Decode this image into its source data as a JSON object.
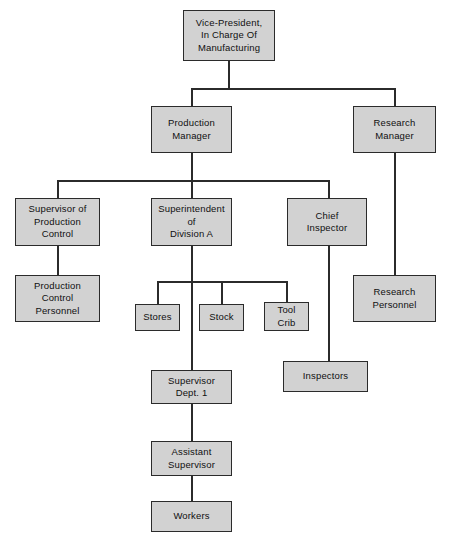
{
  "chart": {
    "type": "org-chart",
    "background_color": "#ffffff",
    "box_fill_color": "#d2d2d2",
    "box_border_color": "#2b2b2b",
    "connector_color": "#2b2b2b",
    "text_color": "#101010"
  },
  "nodes": {
    "vice_president": {
      "label": "Vice-President,\nIn Charge Of\nManufacturing",
      "level": 1
    },
    "production_manager": {
      "label": "Production\nManager",
      "level": 2
    },
    "research_manager": {
      "label": "Research\nManager",
      "level": 2
    },
    "supervisor_production_control": {
      "label": "Supervisor of\nProduction\nControl",
      "level": 3
    },
    "superintendent_division_a": {
      "label": "Superintendent\nof\nDivision A",
      "level": 3
    },
    "chief_inspector": {
      "label": "Chief\nInspector",
      "level": 3
    },
    "production_control_personnel": {
      "label": "Production\nControl\nPersonnel",
      "level": 4
    },
    "stores": {
      "label": "Stores",
      "level": 4
    },
    "stock": {
      "label": "Stock",
      "level": 4
    },
    "tool_crib": {
      "label": "Tool\nCrib",
      "level": 4
    },
    "research_personnel": {
      "label": "Research\nPersonnel",
      "level": 4
    },
    "inspectors": {
      "label": "Inspectors",
      "level": 4
    },
    "supervisor_dept_1": {
      "label": "Supervisor\nDept. 1",
      "level": 5
    },
    "assistant_supervisor": {
      "label": "Assistant\nSupervisor",
      "level": 6
    },
    "workers": {
      "label": "Workers",
      "level": 7
    }
  },
  "edges": [
    {
      "from": "vice_president",
      "to": "production_manager"
    },
    {
      "from": "vice_president",
      "to": "research_manager"
    },
    {
      "from": "production_manager",
      "to": "supervisor_production_control"
    },
    {
      "from": "production_manager",
      "to": "superintendent_division_a"
    },
    {
      "from": "production_manager",
      "to": "chief_inspector"
    },
    {
      "from": "supervisor_production_control",
      "to": "production_control_personnel"
    },
    {
      "from": "superintendent_division_a",
      "to": "stores"
    },
    {
      "from": "superintendent_division_a",
      "to": "stock"
    },
    {
      "from": "superintendent_division_a",
      "to": "tool_crib"
    },
    {
      "from": "superintendent_division_a",
      "to": "supervisor_dept_1"
    },
    {
      "from": "chief_inspector",
      "to": "inspectors"
    },
    {
      "from": "research_manager",
      "to": "research_personnel"
    },
    {
      "from": "supervisor_dept_1",
      "to": "assistant_supervisor"
    },
    {
      "from": "assistant_supervisor",
      "to": "workers"
    }
  ]
}
